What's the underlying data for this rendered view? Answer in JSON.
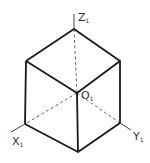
{
  "diagram": {
    "colors": {
      "edge": "#1a1a1a",
      "hidden": "#555555",
      "axis": "#444444"
    },
    "labels": {
      "z": {
        "main": "Z",
        "sub": "1"
      },
      "x": {
        "main": "X",
        "sub": "1"
      },
      "y": {
        "main": "Y",
        "sub": "1"
      },
      "origin": {
        "main": "O",
        "sub": "1"
      }
    }
  }
}
